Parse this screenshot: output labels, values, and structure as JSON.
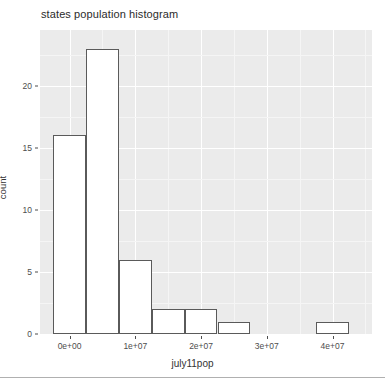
{
  "chart_data": {
    "type": "bar",
    "title": "states population histogram",
    "xlabel": "july11pop",
    "ylabel": "count",
    "grid": true,
    "legend": null,
    "xlim": [
      -4500000,
      46000000
    ],
    "ylim": [
      0,
      24.5
    ],
    "xtick_labels": [
      "0e+00",
      "1e+07",
      "2e+07",
      "3e+07",
      "4e+07"
    ],
    "xtick_values": [
      0,
      10000000,
      20000000,
      30000000,
      40000000
    ],
    "ytick_labels": [
      "0",
      "5",
      "10",
      "15",
      "20"
    ],
    "ytick_values": [
      0,
      5,
      10,
      15,
      20
    ],
    "bin_width": 5000000,
    "categories": [
      "-2.5e+06 – 2.5e+06",
      "2.5e+06 – 7.5e+06",
      "7.5e+06 – 1.25e+07",
      "1.25e+07 – 1.75e+07",
      "1.75e+07 – 2.25e+07",
      "2.25e+07 – 2.75e+07",
      "2.75e+07 – 3.25e+07",
      "3.25e+07 – 3.75e+07",
      "3.75e+07 – 4.25e+07"
    ],
    "bin_starts": [
      -2500000,
      2500000,
      7500000,
      12500000,
      17500000,
      22500000,
      27500000,
      32500000,
      37500000
    ],
    "values": [
      16,
      23,
      6,
      2,
      2,
      1,
      0,
      0,
      1
    ],
    "bar_fill": "#ffffff",
    "bar_stroke": "#5a5a5a",
    "panel_background": "#ebebeb",
    "grid_major_color": "#ffffff",
    "grid_minor_color": "#f5f5f5"
  }
}
